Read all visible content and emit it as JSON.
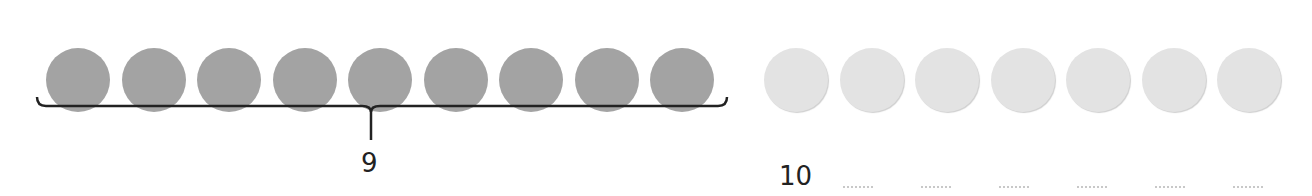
{
  "diagram": {
    "type": "counting-dots",
    "group_counted": {
      "count": 9,
      "color": "#a3a3a3",
      "label": "9"
    },
    "group_extra": {
      "count": 7,
      "color": "#e3e3e3"
    },
    "brace": {
      "spans": "group_counted",
      "label": "9"
    },
    "second_label": "10",
    "answer_blanks": 6
  },
  "labels": {
    "brace_label": "9",
    "next_label": "10"
  }
}
